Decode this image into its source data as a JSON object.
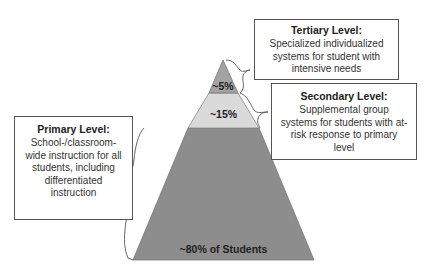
{
  "diagram": {
    "type": "pyramid",
    "tiers": [
      {
        "key": "tertiary",
        "label": "~5%",
        "share_percent": 5,
        "fill": "#a3a3a3"
      },
      {
        "key": "secondary",
        "label": "~15%",
        "share_percent": 15,
        "fill": "#dadada"
      },
      {
        "key": "primary",
        "label": "~80% of Students",
        "share_percent": 80,
        "fill": "#8d8d8d"
      }
    ],
    "boxes": {
      "tertiary": {
        "title": "Tertiary Level:",
        "description": "Specialized individualized systems for student with intensive needs"
      },
      "secondary": {
        "title": "Secondary Level:",
        "description": "Supplemental group systems for students with at-risk response to primary level"
      },
      "primary": {
        "title": "Primary Level:",
        "description": "School-/classroom-wide instruction for all students, including differentiated instruction"
      }
    },
    "outline_color": "#555555"
  }
}
